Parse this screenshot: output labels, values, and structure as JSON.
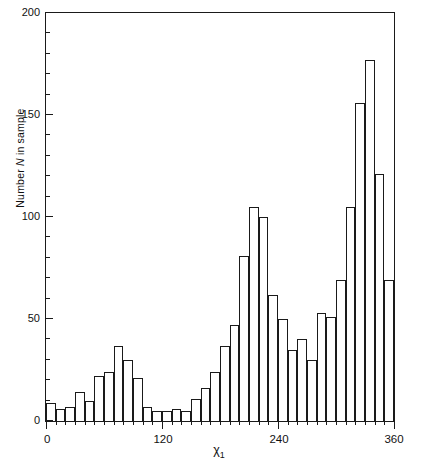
{
  "chart_data": {
    "type": "bar",
    "title": "",
    "subtitle": "",
    "xlabel": "χ₁",
    "xlabel_main": "χ",
    "xlabel_sub": "1",
    "ylabel": "Number N in sample",
    "ylabel_prefix": "Number ",
    "ylabel_italic": "N",
    "ylabel_suffix": " in sample",
    "grid": false,
    "legend": null,
    "xlim": [
      0,
      360
    ],
    "ylim": [
      0,
      200
    ],
    "bin_width": 10,
    "xticks_major": [
      0,
      120,
      240,
      360
    ],
    "xticklabels": [
      "0",
      "120",
      "240",
      "360"
    ],
    "xtick_minor_step": 10,
    "yticks": [
      0,
      50,
      100,
      150,
      200
    ],
    "yticklabels": [
      "0",
      "50",
      "100",
      "150",
      "200"
    ],
    "categories": [
      "0-10",
      "10-20",
      "20-30",
      "30-40",
      "40-50",
      "50-60",
      "60-70",
      "70-80",
      "80-90",
      "90-100",
      "100-110",
      "110-120",
      "120-130",
      "130-140",
      "140-150",
      "150-160",
      "160-170",
      "170-180",
      "180-190",
      "190-200",
      "200-210",
      "210-220",
      "220-230",
      "230-240",
      "240-250",
      "250-260",
      "260-270",
      "270-280",
      "280-290",
      "290-300",
      "300-310",
      "310-320",
      "320-330",
      "330-340",
      "340-350",
      "350-360"
    ],
    "bin_starts": [
      0,
      10,
      20,
      30,
      40,
      50,
      60,
      70,
      80,
      90,
      100,
      110,
      120,
      130,
      140,
      150,
      160,
      170,
      180,
      190,
      200,
      210,
      220,
      230,
      240,
      250,
      260,
      270,
      280,
      290,
      300,
      310,
      320,
      330,
      340,
      350
    ],
    "values": [
      9,
      6,
      7,
      14,
      10,
      22,
      24,
      37,
      30,
      21,
      7,
      5,
      5,
      6,
      5,
      11,
      16,
      24,
      37,
      47,
      81,
      105,
      100,
      62,
      50,
      35,
      40,
      30,
      53,
      51,
      69,
      105,
      156,
      177,
      121,
      69
    ],
    "peaks": [
      {
        "bin": "70-80",
        "value": 37
      },
      {
        "bin": "210-220",
        "value": 105
      },
      {
        "bin": "330-340",
        "value": 177
      }
    ],
    "series_name": "Number N in sample"
  }
}
